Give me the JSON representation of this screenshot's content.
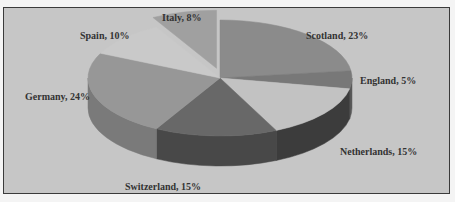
{
  "chart_data": {
    "type": "pie",
    "style": "3d-exploded",
    "title": "",
    "categories": [
      "Scotland",
      "England",
      "Netherlands",
      "Switzerland",
      "Germany",
      "Spain",
      "Italy"
    ],
    "values": [
      23,
      5,
      15,
      15,
      24,
      10,
      8
    ],
    "unit": "%",
    "exploded": [
      "Italy"
    ],
    "colors": [
      "#8b8b8b",
      "#787878",
      "#c2c2c2",
      "#686868",
      "#979797",
      "#c9c9c9",
      "#a0a0a0"
    ],
    "side_colors": [
      "#6e6e6e",
      "#5a5a5a",
      "#3c3c3c",
      "#484848",
      "#7a7a7a",
      "#a8a8a8",
      "#808080"
    ],
    "labels": [
      {
        "text": "Scotland, 23%",
        "x": 306,
        "y": 30
      },
      {
        "text": "England, 5%",
        "x": 360,
        "y": 75
      },
      {
        "text": "Netherlands, 15%",
        "x": 340,
        "y": 146
      },
      {
        "text": "Switzerland, 15%",
        "x": 125,
        "y": 181
      },
      {
        "text": "Germany, 24%",
        "x": 25,
        "y": 91
      },
      {
        "text": "Spain, 10%",
        "x": 80,
        "y": 30
      },
      {
        "text": "Italy, 8%",
        "x": 162,
        "y": 12
      }
    ],
    "legend": "none"
  }
}
